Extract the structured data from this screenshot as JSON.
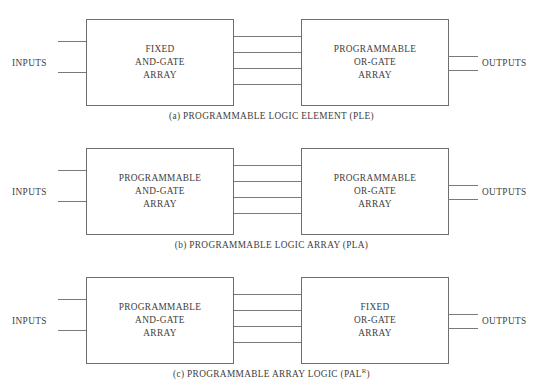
{
  "figure": {
    "diagrams": [
      {
        "id": "ple",
        "left_box": {
          "line1": "FIXED",
          "line2": "AND-GATE",
          "line3": "ARRAY"
        },
        "right_box": {
          "line1": "PROGRAMMABLE",
          "line2": "OR-GATE",
          "line3": "ARRAY"
        },
        "inputs_label": "INPUTS",
        "outputs_label": "OUTPUTS",
        "caption_prefix": "(a)",
        "caption_text": "PROGRAMMABLE LOGIC ELEMENT (PLE)",
        "caption_superscript": "",
        "caption_suffix": "",
        "interconnect_count": 4,
        "input_wire_count": 2,
        "output_wire_count": 2
      },
      {
        "id": "pla",
        "left_box": {
          "line1": "PROGRAMMABLE",
          "line2": "AND-GATE",
          "line3": "ARRAY"
        },
        "right_box": {
          "line1": "PROGRAMMABLE",
          "line2": "OR-GATE",
          "line3": "ARRAY"
        },
        "inputs_label": "INPUTS",
        "outputs_label": "OUTPUTS",
        "caption_prefix": "(b)",
        "caption_text": "PROGRAMMABLE LOGIC ARRAY (PLA)",
        "caption_superscript": "",
        "caption_suffix": "",
        "interconnect_count": 4,
        "input_wire_count": 2,
        "output_wire_count": 2
      },
      {
        "id": "pal",
        "left_box": {
          "line1": "PROGRAMMABLE",
          "line2": "AND-GATE",
          "line3": "ARRAY"
        },
        "right_box": {
          "line1": "FIXED",
          "line2": "OR-GATE",
          "line3": "ARRAY"
        },
        "inputs_label": "INPUTS",
        "outputs_label": "OUTPUTS",
        "caption_prefix": "(c)",
        "caption_text": "PROGRAMMABLE ARRAY LOGIC (PAL",
        "caption_superscript": "R",
        "caption_suffix": ")",
        "interconnect_count": 4,
        "input_wire_count": 2,
        "output_wire_count": 2
      }
    ]
  },
  "colors": {
    "background": "#ffffff",
    "box_border": "#6e6e6e",
    "wire": "#7a7a7a",
    "text": "#3d3d3d"
  }
}
